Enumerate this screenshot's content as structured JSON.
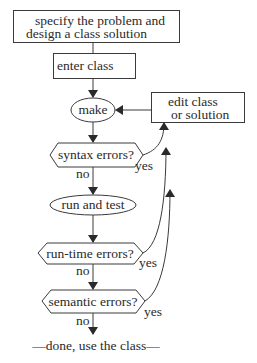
{
  "diagram": {
    "type": "flowchart",
    "nodes": {
      "specify": {
        "line1": "specify the problem and",
        "line2": "design a class solution",
        "shape": "rectangle"
      },
      "enter": {
        "label": "enter class",
        "shape": "rectangle"
      },
      "make": {
        "label": "make",
        "shape": "ellipse"
      },
      "edit": {
        "line1": "edit class",
        "line2": "or solution",
        "shape": "rectangle"
      },
      "syntax": {
        "label": "syntax errors?",
        "shape": "hexagon"
      },
      "run": {
        "label": "run and test",
        "shape": "ellipse"
      },
      "runtime": {
        "label": "run-time errors?",
        "shape": "hexagon"
      },
      "semantic": {
        "label": "semantic errors?",
        "shape": "hexagon"
      },
      "done": {
        "label": "—done, use the class—",
        "shape": "terminal-text"
      }
    },
    "edge_labels": {
      "syntax_no": "no",
      "syntax_yes": "yes",
      "runtime_no": "no",
      "runtime_yes": "yes",
      "semantic_no": "no",
      "semantic_yes": "yes"
    },
    "edges": [
      {
        "from": "specify",
        "to": "enter"
      },
      {
        "from": "enter",
        "to": "make"
      },
      {
        "from": "edit",
        "to": "make"
      },
      {
        "from": "make",
        "to": "syntax"
      },
      {
        "from": "syntax",
        "to": "run",
        "label": "no"
      },
      {
        "from": "syntax",
        "to": "edit",
        "label": "yes"
      },
      {
        "from": "run",
        "to": "runtime"
      },
      {
        "from": "runtime",
        "to": "semantic",
        "label": "no"
      },
      {
        "from": "runtime",
        "to": "edit",
        "label": "yes"
      },
      {
        "from": "semantic",
        "to": "done",
        "label": "no"
      },
      {
        "from": "semantic",
        "to": "edit",
        "label": "yes"
      }
    ],
    "colors": {
      "stroke": "#3a3a3a",
      "text": "#2a2a2a",
      "background": "#ffffff"
    }
  }
}
